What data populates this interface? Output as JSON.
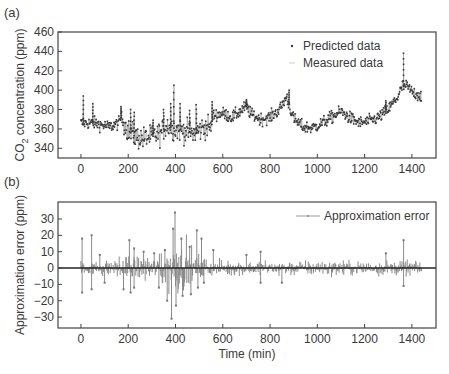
{
  "chart_data": [
    {
      "id": "a",
      "panel_label": "(a)",
      "type": "scatter",
      "title": "",
      "xlabel": "",
      "ylabel": "CO2 concentration (ppm)",
      "ylabel_parts": {
        "pre": "CO",
        "sub": "2",
        "post": " concentration (ppm)"
      },
      "xlim": [
        -97,
        1502
      ],
      "ylim": [
        330,
        460
      ],
      "xticks": [
        0,
        200,
        400,
        600,
        800,
        1000,
        1200,
        1400
      ],
      "yticks": [
        340,
        360,
        380,
        400,
        420,
        440,
        460
      ],
      "grid": false,
      "legend_position": "upper center-right",
      "legend": [
        "Predicted data",
        "Measured data"
      ],
      "x_range": [
        0,
        1440
      ],
      "baseline_keypoints": {
        "x": [
          0,
          10,
          60,
          120,
          160,
          170,
          200,
          230,
          260,
          300,
          340,
          360,
          400,
          440,
          480,
          520,
          550,
          560,
          600,
          640,
          700,
          720,
          760,
          800,
          840,
          870,
          900,
          940,
          980,
          1020,
          1060,
          1100,
          1140,
          1180,
          1220,
          1260,
          1300,
          1340,
          1360,
          1380,
          1400,
          1440
        ],
        "y": [
          366,
          366,
          366,
          362,
          366,
          372,
          358,
          352,
          350,
          352,
          356,
          364,
          360,
          358,
          355,
          362,
          362,
          374,
          376,
          372,
          383,
          375,
          370,
          372,
          380,
          393,
          370,
          362,
          361,
          366,
          372,
          378,
          371,
          366,
          368,
          372,
          380,
          393,
          404,
          404,
          398,
          394
        ]
      },
      "spikes": [
        {
          "x": 10,
          "y": 394
        },
        {
          "x": 50,
          "y": 386
        },
        {
          "x": 170,
          "y": 383
        },
        {
          "x": 210,
          "y": 380
        },
        {
          "x": 225,
          "y": 377
        },
        {
          "x": 305,
          "y": 369
        },
        {
          "x": 350,
          "y": 380
        },
        {
          "x": 380,
          "y": 386
        },
        {
          "x": 393,
          "y": 405
        },
        {
          "x": 420,
          "y": 386
        },
        {
          "x": 460,
          "y": 379
        },
        {
          "x": 488,
          "y": 385
        },
        {
          "x": 555,
          "y": 388
        },
        {
          "x": 700,
          "y": 390
        },
        {
          "x": 880,
          "y": 400
        },
        {
          "x": 1290,
          "y": 389
        },
        {
          "x": 1365,
          "y": 438
        }
      ],
      "series": [
        {
          "name": "Predicted data",
          "marker": "dot",
          "color": "#3a3a3a"
        },
        {
          "name": "Measured data",
          "marker": "line",
          "color": "#9a9a9a"
        }
      ]
    },
    {
      "id": "b",
      "panel_label": "(b)",
      "type": "line",
      "title": "",
      "xlabel": "Time (min)",
      "ylabel": "Approximation error (ppm)",
      "xlim": [
        -97,
        1502
      ],
      "ylim": [
        -36.7,
        40.4
      ],
      "xticks": [
        0,
        200,
        400,
        600,
        800,
        1000,
        1200,
        1400
      ],
      "yticks": [
        -30,
        -20,
        -10,
        0,
        10,
        20,
        30
      ],
      "grid": false,
      "zero_line": true,
      "legend_position": "upper right",
      "legend": [
        "Approximation error"
      ],
      "x_range": [
        0,
        1440
      ],
      "spikes": [
        {
          "x": 5,
          "y": 18
        },
        {
          "x": 5,
          "y": -15
        },
        {
          "x": 45,
          "y": 20
        },
        {
          "x": 45,
          "y": -13
        },
        {
          "x": 80,
          "y": 8
        },
        {
          "x": 100,
          "y": -9
        },
        {
          "x": 180,
          "y": -13
        },
        {
          "x": 205,
          "y": 17
        },
        {
          "x": 210,
          "y": -15
        },
        {
          "x": 225,
          "y": 12
        },
        {
          "x": 225,
          "y": -12
        },
        {
          "x": 265,
          "y": 10
        },
        {
          "x": 310,
          "y": 9
        },
        {
          "x": 330,
          "y": -12
        },
        {
          "x": 355,
          "y": 11
        },
        {
          "x": 365,
          "y": -20
        },
        {
          "x": 383,
          "y": -31
        },
        {
          "x": 390,
          "y": 24
        },
        {
          "x": 398,
          "y": 34
        },
        {
          "x": 402,
          "y": -23
        },
        {
          "x": 425,
          "y": 18
        },
        {
          "x": 430,
          "y": -17
        },
        {
          "x": 460,
          "y": 13
        },
        {
          "x": 465,
          "y": -16
        },
        {
          "x": 490,
          "y": 23
        },
        {
          "x": 495,
          "y": -12
        },
        {
          "x": 510,
          "y": 18
        },
        {
          "x": 520,
          "y": -9
        },
        {
          "x": 560,
          "y": 11
        },
        {
          "x": 700,
          "y": 8
        },
        {
          "x": 760,
          "y": 10
        },
        {
          "x": 760,
          "y": -9
        },
        {
          "x": 850,
          "y": -9
        },
        {
          "x": 1290,
          "y": 9
        },
        {
          "x": 1365,
          "y": 17
        },
        {
          "x": 1365,
          "y": -11
        }
      ],
      "series": [
        {
          "name": "Approximation error",
          "color": "#8a8a8a"
        }
      ]
    }
  ],
  "style": {
    "axis_color": "#444444",
    "predicted_color": "#3a3a3a",
    "measured_color": "#9a9a9a",
    "error_color": "#8a8a8a"
  }
}
